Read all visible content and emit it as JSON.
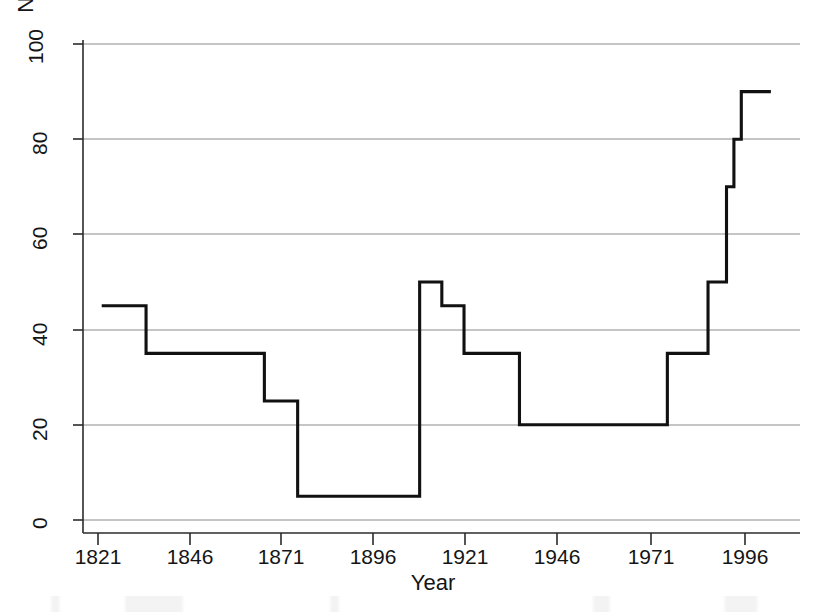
{
  "chart_data": {
    "type": "line",
    "title": "",
    "subtitle": "",
    "xlabel": "Year",
    "ylabel": "Normalized polity score (0 to 100)",
    "xlim": [
      1821,
      2006
    ],
    "ylim": [
      0,
      100
    ],
    "xticks": [
      1821,
      1846,
      1871,
      1896,
      1921,
      1946,
      1971,
      1996
    ],
    "yticks": [
      0,
      20,
      40,
      60,
      80,
      100
    ],
    "grid": "horizontal",
    "legend": "none",
    "step_style": "post",
    "series": [
      {
        "name": "Normalized polity score",
        "color": "#111111",
        "x": [
          1822,
          1834,
          1834,
          1866,
          1866,
          1875,
          1875,
          1908,
          1908,
          1914,
          1914,
          1920,
          1920,
          1935,
          1935,
          1975,
          1975,
          1986,
          1986,
          1991,
          1991,
          1993,
          1993,
          1995,
          1995,
          2003
        ],
        "y": [
          45,
          45,
          35,
          35,
          25,
          25,
          5,
          5,
          50,
          50,
          45,
          45,
          35,
          35,
          20,
          20,
          35,
          35,
          50,
          50,
          70,
          70,
          80,
          80,
          90,
          90
        ],
        "points": [
          {
            "year": 1822,
            "value": 45
          },
          {
            "year": 1834,
            "value": 35
          },
          {
            "year": 1866,
            "value": 25
          },
          {
            "year": 1875,
            "value": 5
          },
          {
            "year": 1908,
            "value": 50
          },
          {
            "year": 1914,
            "value": 45
          },
          {
            "year": 1920,
            "value": 35
          },
          {
            "year": 1935,
            "value": 20
          },
          {
            "year": 1975,
            "value": 35
          },
          {
            "year": 1986,
            "value": 50
          },
          {
            "year": 1991,
            "value": 70
          },
          {
            "year": 1993,
            "value": 80
          },
          {
            "year": 1995,
            "value": 90
          },
          {
            "year": 2003,
            "value": 90
          }
        ]
      }
    ]
  },
  "axes": {
    "y_tick_labels": [
      "0",
      "20",
      "40",
      "60",
      "80",
      "100"
    ],
    "x_tick_labels": [
      "1821",
      "1846",
      "1871",
      "1896",
      "1921",
      "1946",
      "1971",
      "1996"
    ],
    "y_axis_title": "Normalized polity score (0 to 100)",
    "x_axis_title": "Year"
  },
  "colors": {
    "line": "#111111",
    "grid": "#8a8a8a",
    "axis": "#2b2b2b",
    "background": "#ffffff",
    "text": "#151515"
  }
}
